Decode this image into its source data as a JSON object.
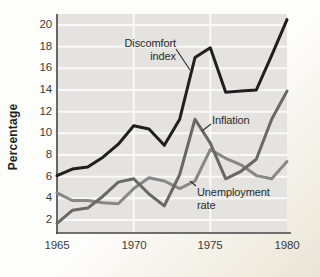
{
  "chart_data": {
    "type": "line",
    "title": "",
    "xlabel": "",
    "ylabel": "Percentage",
    "x": [
      1965,
      1966,
      1967,
      1968,
      1969,
      1970,
      1971,
      1972,
      1973,
      1974,
      1975,
      1976,
      1977,
      1978,
      1979,
      1980
    ],
    "xticks": [
      1965,
      1970,
      1975,
      1980
    ],
    "yticks": [
      2,
      4,
      6,
      8,
      10,
      12,
      14,
      16,
      18,
      20
    ],
    "xlim": [
      1965,
      1980
    ],
    "ylim": [
      0.8,
      21
    ],
    "grid": "white horizontal gridlines at each y tick and vertical gridlines at 1970 and 1975 on gray plot background",
    "legend_position": "inline labels with pointer lines",
    "series": [
      {
        "name": "Discomfort index",
        "color": "#1f1f1f",
        "values": [
          6.1,
          6.7,
          6.9,
          7.8,
          9.0,
          10.7,
          10.4,
          8.9,
          11.3,
          17.0,
          17.9,
          13.8,
          13.9,
          14.0,
          17.2,
          20.5
        ]
      },
      {
        "name": "Inflation",
        "color": "#686868",
        "values": [
          1.7,
          2.9,
          3.1,
          4.2,
          5.5,
          5.8,
          4.4,
          3.3,
          6.2,
          11.3,
          9.1,
          5.8,
          6.5,
          7.6,
          11.3,
          13.9
        ]
      },
      {
        "name": "Unemployment rate",
        "color": "#878787",
        "values": [
          4.5,
          3.8,
          3.8,
          3.6,
          3.5,
          4.9,
          5.9,
          5.6,
          4.9,
          5.6,
          8.5,
          7.7,
          7.1,
          6.1,
          5.8,
          7.4
        ]
      }
    ]
  },
  "annotations": {
    "discomfort": {
      "line1": "Discomfort",
      "line2": "index"
    },
    "inflation": {
      "text": "Inflation"
    },
    "unemployment": {
      "line1": "Unemployment",
      "line2": "rate"
    }
  },
  "colors": {
    "plot_bg": "#e4e3e0",
    "grid_line": "#f9f9f7",
    "axis": "#454545",
    "tick_text": "#3c3c3c",
    "label_text": "#2a2a2a"
  }
}
